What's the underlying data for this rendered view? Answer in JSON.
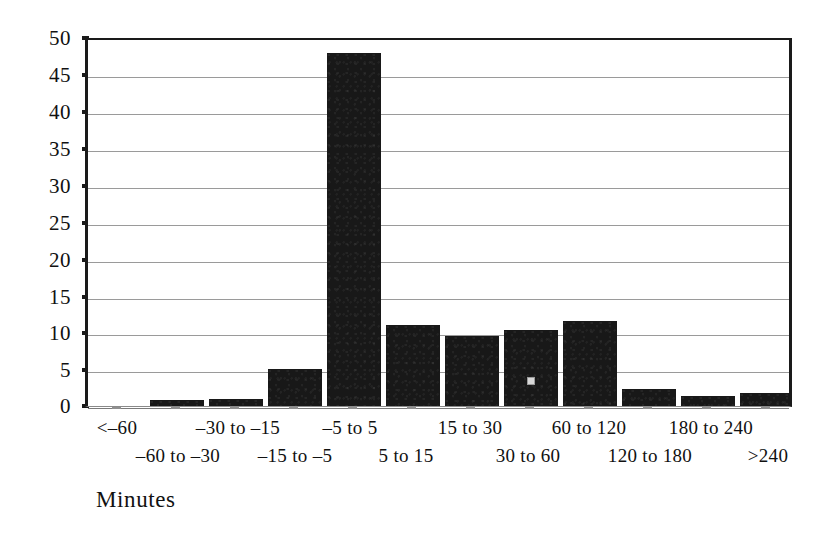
{
  "chart_data": {
    "type": "bar",
    "title": "",
    "subtitle": "",
    "xlabel": "Minutes",
    "ylabel": "",
    "categories": [
      "<–60",
      "–60 to –30",
      "–30 to –15",
      "–15 to –5",
      "–5 to 5",
      "5 to 15",
      "15 to 30",
      "30 to 60",
      "60 to 120",
      "120 to 180",
      "180 to 240",
      ">240"
    ],
    "values": [
      0,
      0.8,
      1.0,
      5.0,
      48.0,
      11.0,
      9.5,
      10.3,
      11.5,
      2.3,
      1.4,
      1.7
    ],
    "ylim": [
      0,
      50
    ],
    "yticks": [
      0,
      5,
      10,
      15,
      20,
      25,
      30,
      35,
      40,
      45,
      50
    ],
    "ytick_labels": [
      "0",
      "5",
      "10",
      "15",
      "20",
      "25",
      "30",
      "35",
      "40",
      "45",
      "50"
    ],
    "grid": true,
    "grid_axis": "y",
    "legend": false,
    "legend_position": "none",
    "bar_color": "#181818",
    "axis_color": "#1a1a1a",
    "grid_color": "#9a9a9a",
    "background_color": "#ffffff",
    "series": [
      {
        "name": "Frequency",
        "values": [
          0,
          0.8,
          1.0,
          5.0,
          48.0,
          11.0,
          9.5,
          10.3,
          11.5,
          2.3,
          1.4,
          1.7
        ]
      }
    ],
    "label_layout": "staggered-two-rows",
    "label_rows": {
      "top": [
        "<–60",
        "–30 to –15",
        "–5 to 5",
        "15 to 30",
        "60 to 120",
        "180 to 240"
      ],
      "bottom": [
        "–60 to –30",
        "–15 to –5",
        "5 to 15",
        "30 to 60",
        "120 to 180",
        ">240"
      ]
    }
  }
}
